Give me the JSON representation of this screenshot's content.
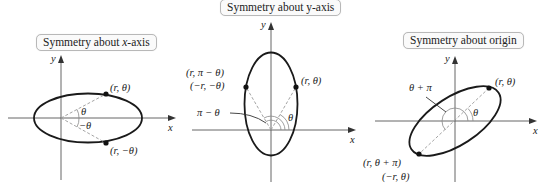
{
  "panels": [
    {
      "id": "x-axis-symmetry",
      "title_prefix": "Symmetry about ",
      "title_var": "x",
      "title_suffix": "-axis",
      "axis_labels": {
        "x": "x",
        "y": "y"
      },
      "points": [
        {
          "label": "(r, θ)"
        },
        {
          "label": "(r, −θ)"
        }
      ],
      "angles": [
        {
          "label": "θ"
        },
        {
          "label": "−θ"
        }
      ]
    },
    {
      "id": "y-axis-symmetry",
      "title": "Symmetry about y-axis",
      "axis_labels": {
        "x": "x",
        "y": "y"
      },
      "points": [
        {
          "label": "(r, θ)"
        },
        {
          "label_line1": "(r, π − θ)",
          "label_line2": "(−r, −θ)"
        }
      ],
      "angles": [
        {
          "label": "θ"
        },
        {
          "label": "π − θ"
        }
      ]
    },
    {
      "id": "origin-symmetry",
      "title": "Symmetry about origin",
      "axis_labels": {
        "x": "x",
        "y": "y"
      },
      "points": [
        {
          "label": "(r, θ)"
        },
        {
          "label_line1": "(r, θ + π)",
          "label_line2": "(−r, θ)"
        }
      ],
      "angles": [
        {
          "label": "θ"
        },
        {
          "label": "θ + π"
        }
      ]
    }
  ]
}
